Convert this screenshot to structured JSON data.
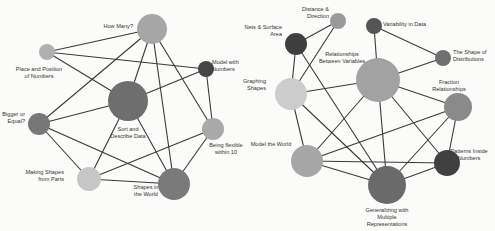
{
  "colors": {
    "background": "#fbfbfa",
    "edge": "#3a3a3a",
    "label": "#333333"
  },
  "networks": [
    {
      "name": "left-network",
      "nodes": [
        {
          "id": "how-many",
          "label": [
            "How Many?"
          ],
          "x": 152,
          "y": 29,
          "r": 15,
          "color": "#a6a6a6",
          "lx": 133,
          "ly": 28,
          "anchor": "end"
        },
        {
          "id": "place-position",
          "label": [
            "Place and Position",
            "of Numbers"
          ],
          "x": 47,
          "y": 52,
          "r": 8,
          "color": "#b0b0b0",
          "lx": 39,
          "ly": 71,
          "anchor": "middle"
        },
        {
          "id": "model-numbers",
          "label": [
            "Model with",
            "Numbers"
          ],
          "x": 206,
          "y": 69,
          "r": 8,
          "color": "#454545",
          "lx": 212,
          "ly": 64,
          "anchor": "start"
        },
        {
          "id": "sort-describe",
          "label": [
            "Sort and",
            "Describe Data"
          ],
          "x": 128,
          "y": 101,
          "r": 20,
          "color": "#6e6e6e",
          "lx": 128,
          "ly": 131,
          "anchor": "middle"
        },
        {
          "id": "bigger-equal",
          "label": [
            "Bigger or",
            "Equal?"
          ],
          "x": 39,
          "y": 124,
          "r": 11,
          "color": "#777777",
          "lx": 25,
          "ly": 116,
          "anchor": "end"
        },
        {
          "id": "being-flexible",
          "label": [
            "Being flexible",
            "within 10"
          ],
          "x": 213,
          "y": 129,
          "r": 11,
          "color": "#a9a9a9",
          "lx": 226,
          "ly": 147,
          "anchor": "middle"
        },
        {
          "id": "making-shapes",
          "label": [
            "Making Shapes",
            "from Parts"
          ],
          "x": 89,
          "y": 179,
          "r": 12,
          "color": "#c6c6c6",
          "lx": 64,
          "ly": 174,
          "anchor": "end"
        },
        {
          "id": "shapes-world",
          "label": [
            "Shapes in",
            "the World"
          ],
          "x": 174,
          "y": 184,
          "r": 16,
          "color": "#7a7a7a",
          "lx": 146,
          "ly": 189,
          "anchor": "middle"
        }
      ],
      "edges": [
        [
          "place-position",
          "how-many"
        ],
        [
          "place-position",
          "model-numbers"
        ],
        [
          "place-position",
          "sort-describe"
        ],
        [
          "how-many",
          "bigger-equal"
        ],
        [
          "how-many",
          "sort-describe"
        ],
        [
          "how-many",
          "shapes-world"
        ],
        [
          "how-many",
          "being-flexible"
        ],
        [
          "model-numbers",
          "sort-describe"
        ],
        [
          "model-numbers",
          "being-flexible"
        ],
        [
          "bigger-equal",
          "sort-describe"
        ],
        [
          "bigger-equal",
          "making-shapes"
        ],
        [
          "bigger-equal",
          "shapes-world"
        ],
        [
          "sort-describe",
          "making-shapes"
        ],
        [
          "sort-describe",
          "shapes-world"
        ],
        [
          "making-shapes",
          "being-flexible"
        ],
        [
          "making-shapes",
          "shapes-world"
        ],
        [
          "being-flexible",
          "shapes-world"
        ]
      ]
    },
    {
      "name": "right-network",
      "nodes": [
        {
          "id": "distance-direction",
          "label": [
            "Distance &",
            "Direction"
          ],
          "x": 338,
          "y": 21,
          "r": 8,
          "color": "#9a9a9a",
          "lx": 329,
          "ly": 11,
          "anchor": "end"
        },
        {
          "id": "nets-surface",
          "label": [
            "Nets & Surface",
            "Area"
          ],
          "x": 296,
          "y": 44,
          "r": 11,
          "color": "#3e3e3e",
          "lx": 282,
          "ly": 29,
          "anchor": "end"
        },
        {
          "id": "variability",
          "label": [
            "Variability in Data"
          ],
          "x": 374,
          "y": 26,
          "r": 8,
          "color": "#555555",
          "lx": 383,
          "ly": 26,
          "anchor": "start"
        },
        {
          "id": "shape-distributions",
          "label": [
            "The Shape of",
            "Distributions"
          ],
          "x": 443,
          "y": 58,
          "r": 8,
          "color": "#707070",
          "lx": 453,
          "ly": 54,
          "anchor": "start"
        },
        {
          "id": "relationships",
          "label": [
            "Relationships",
            "Between Variables"
          ],
          "x": 378,
          "y": 80,
          "r": 22,
          "color": "#a2a2a2",
          "lx": 342,
          "ly": 56,
          "anchor": "middle"
        },
        {
          "id": "graphing-shapes",
          "label": [
            "Graphing",
            "Shapes"
          ],
          "x": 291,
          "y": 94,
          "r": 16,
          "color": "#cccccc",
          "lx": 266,
          "ly": 83,
          "anchor": "end"
        },
        {
          "id": "fraction-relationships",
          "label": [
            "Fraction",
            "Relationships"
          ],
          "x": 458,
          "y": 107,
          "r": 14,
          "color": "#8a8a8a",
          "lx": 449,
          "ly": 84,
          "anchor": "middle"
        },
        {
          "id": "model-world",
          "label": [
            "Model the World"
          ],
          "x": 307,
          "y": 161,
          "r": 16,
          "color": "#a6a6a6",
          "lx": 271,
          "ly": 146,
          "anchor": "middle"
        },
        {
          "id": "patterns-inside",
          "label": [
            "Patterns Inside",
            "Numbers"
          ],
          "x": 447,
          "y": 163,
          "r": 13,
          "color": "#404040",
          "lx": 469,
          "ly": 153,
          "anchor": "middle"
        },
        {
          "id": "generalizing",
          "label": [
            "Generalizing with",
            "Multiple",
            "Representations"
          ],
          "x": 387,
          "y": 185,
          "r": 19,
          "color": "#6a6a6a",
          "lx": 387,
          "ly": 212,
          "anchor": "middle"
        }
      ],
      "edges": [
        [
          "distance-direction",
          "nets-surface"
        ],
        [
          "distance-direction",
          "graphing-shapes"
        ],
        [
          "nets-surface",
          "graphing-shapes"
        ],
        [
          "nets-surface",
          "generalizing"
        ],
        [
          "variability",
          "relationships"
        ],
        [
          "variability",
          "shape-distributions"
        ],
        [
          "shape-distributions",
          "relationships"
        ],
        [
          "relationships",
          "graphing-shapes"
        ],
        [
          "relationships",
          "fraction-relationships"
        ],
        [
          "relationships",
          "model-world"
        ],
        [
          "relationships",
          "generalizing"
        ],
        [
          "relationships",
          "patterns-inside"
        ],
        [
          "graphing-shapes",
          "model-world"
        ],
        [
          "graphing-shapes",
          "generalizing"
        ],
        [
          "fraction-relationships",
          "model-world"
        ],
        [
          "fraction-relationships",
          "patterns-inside"
        ],
        [
          "fraction-relationships",
          "generalizing"
        ],
        [
          "model-world",
          "patterns-inside"
        ],
        [
          "model-world",
          "generalizing"
        ],
        [
          "patterns-inside",
          "generalizing"
        ]
      ]
    }
  ]
}
